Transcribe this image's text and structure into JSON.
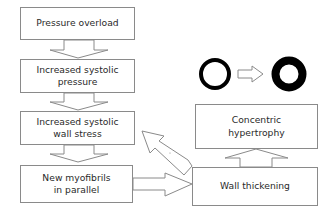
{
  "diagram": {
    "left_chain": [
      {
        "id": "pressure-overload",
        "label": "Pressure overload"
      },
      {
        "id": "increased-systolic-pressure",
        "label": "Increased systolic\npressure"
      },
      {
        "id": "increased-systolic-wall-stress",
        "label": "Increased systolic\nwall stress"
      },
      {
        "id": "new-myofibrils",
        "label": "New myofibrils\nin parallel"
      }
    ],
    "right_chain": [
      {
        "id": "wall-thickening",
        "label": "Wall thickening"
      },
      {
        "id": "concentric-hypertrophy",
        "label": "Concentric\nhypertrophy"
      }
    ],
    "illustration": {
      "description": "Thin-walled ring becomes thick-walled ring",
      "before": "thin-ring",
      "after": "thick-ring"
    },
    "edges": [
      {
        "from": "pressure-overload",
        "to": "increased-systolic-pressure"
      },
      {
        "from": "increased-systolic-pressure",
        "to": "increased-systolic-wall-stress"
      },
      {
        "from": "increased-systolic-wall-stress",
        "to": "new-myofibrils"
      },
      {
        "from": "new-myofibrils",
        "to": "wall-thickening"
      },
      {
        "from": "wall-thickening",
        "to": "concentric-hypertrophy"
      },
      {
        "from": "wall-thickening",
        "to": "increased-systolic-wall-stress",
        "type": "feedback"
      }
    ],
    "colors": {
      "stroke": "#8a8a8a",
      "ring": "#000000",
      "background": "#ffffff"
    }
  }
}
